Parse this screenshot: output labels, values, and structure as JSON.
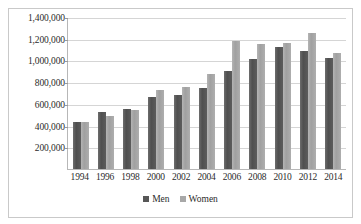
{
  "chart_data": {
    "type": "bar",
    "title": "",
    "subtitle": "",
    "xlabel": "",
    "ylabel": "",
    "categories": [
      "1994",
      "1996",
      "1998",
      "2000",
      "2002",
      "2004",
      "2006",
      "2008",
      "2010",
      "2012",
      "2014"
    ],
    "series": [
      {
        "name": "Men",
        "color": "#575757",
        "values": [
          430000,
          525000,
          555000,
          660000,
          680000,
          750000,
          905000,
          1010000,
          1120000,
          1085000,
          1025000
        ]
      },
      {
        "name": "Women",
        "color": "#a8a8a8",
        "values": [
          432000,
          490000,
          540000,
          730000,
          755000,
          875000,
          1180000,
          1155000,
          1165000,
          1250000,
          1065000
        ]
      }
    ],
    "ylim": [
      0,
      1400000
    ],
    "ytick_values": [
      200000,
      400000,
      600000,
      800000,
      1000000,
      1200000,
      1400000
    ],
    "ytick_labels": [
      "200,000",
      "400,000",
      "600,000",
      "800,000",
      "1,000,000",
      "1,200,000",
      "1,400,000"
    ],
    "grid": true,
    "legend_position": "bottom",
    "legend_entries": [
      "Men",
      "Women"
    ]
  }
}
